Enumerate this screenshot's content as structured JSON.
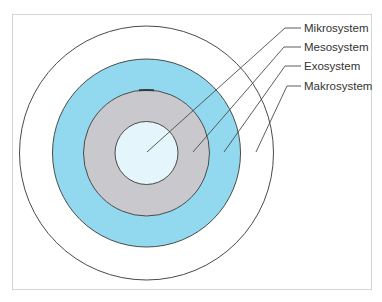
{
  "diagram": {
    "type": "concentric-circles",
    "center": [
      146.5,
      153
    ],
    "colors": {
      "outer_fill": "#ffffff",
      "ring_blue": "#92d9ef",
      "ring_gray": "#c9c9cd",
      "inner_fill": "#e4f6fb",
      "stroke": "#4a4a4a",
      "leader": "#4a4a4a",
      "frame_border": "#d6d6d6"
    },
    "labels": [
      {
        "text": "Mikrosystem",
        "target": "inner-circle"
      },
      {
        "text": "Mesosystem",
        "target": "gray-ring"
      },
      {
        "text": "Exosystem",
        "target": "blue-ring"
      },
      {
        "text": "Makrosystem",
        "target": "outer-ring"
      }
    ]
  }
}
